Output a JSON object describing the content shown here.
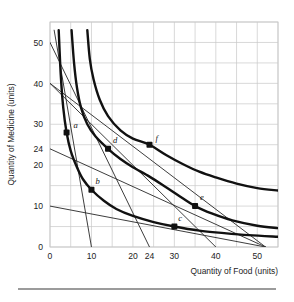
{
  "figure": {
    "name": "indifference-curve-budget-line-graph",
    "background": "#ffffff",
    "grid_color": "#c9c9c9",
    "curve_color": "#111111",
    "line_color": "#333333",
    "point_color": "#111111"
  },
  "axes": {
    "x_title": "Quantity of Food (units)",
    "y_title": "Quantity of Medicine (units)",
    "x_ticks": [
      "0",
      "10",
      "20",
      "24",
      "30",
      "40",
      "50"
    ],
    "y_ticks": [
      "0",
      "10",
      "20",
      "24",
      "30",
      "40",
      "50"
    ],
    "x_min": 0,
    "x_max": 55,
    "y_min": 0,
    "y_max": 55,
    "grid_step": 5
  },
  "chart_data": {
    "type": "line",
    "title": "",
    "xlabel": "Quantity of Food (units)",
    "ylabel": "Quantity of Medicine (units)",
    "xlim": [
      0,
      55
    ],
    "ylim": [
      0,
      55
    ],
    "grid": true,
    "legend": "none",
    "x_ticks": [
      0,
      10,
      20,
      24,
      30,
      40,
      50
    ],
    "y_ticks": [
      0,
      10,
      20,
      24,
      30,
      40,
      50
    ],
    "series": [
      {
        "name": "indifference-curve-1",
        "kind": "indifference-curve",
        "note": "lowest curve, passes through points b and c",
        "points": [
          [
            2.1,
            53
          ],
          [
            2.6,
            42
          ],
          [
            3.2,
            34
          ],
          [
            4.0,
            28
          ],
          [
            5.0,
            23.5
          ],
          [
            6.5,
            19.5
          ],
          [
            8.0,
            16.5
          ],
          [
            10.0,
            14.0
          ],
          [
            13.0,
            11.3
          ],
          [
            16.0,
            9.3
          ],
          [
            20.0,
            7.6
          ],
          [
            25.0,
            6.1
          ],
          [
            30.0,
            5.0
          ],
          [
            36.0,
            4.0
          ],
          [
            42.0,
            3.4
          ],
          [
            48.0,
            2.9
          ],
          [
            55.0,
            2.5
          ]
        ]
      },
      {
        "name": "indifference-curve-2",
        "kind": "indifference-curve",
        "note": "middle curve, passes through points a, d and e",
        "points": [
          [
            5.2,
            53
          ],
          [
            5.8,
            45
          ],
          [
            6.5,
            39
          ],
          [
            7.5,
            34
          ],
          [
            9.0,
            30
          ],
          [
            11.0,
            27
          ],
          [
            14.0,
            24.0
          ],
          [
            17.0,
            21.5
          ],
          [
            20.0,
            19.5
          ],
          [
            24.0,
            17.2
          ],
          [
            28.0,
            14.6
          ],
          [
            31.0,
            12.6
          ],
          [
            35.0,
            10.0
          ],
          [
            39.0,
            8.2
          ],
          [
            44.0,
            6.5
          ],
          [
            50.0,
            5.2
          ],
          [
            55.0,
            4.6
          ]
        ]
      },
      {
        "name": "indifference-curve-3",
        "kind": "indifference-curve",
        "note": "highest curve, passes through point f",
        "points": [
          [
            9.0,
            53
          ],
          [
            9.6,
            46
          ],
          [
            10.5,
            41
          ],
          [
            12.0,
            36
          ],
          [
            14.0,
            32
          ],
          [
            17.0,
            28.5
          ],
          [
            20.0,
            26.5
          ],
          [
            24.0,
            25.0
          ],
          [
            28.0,
            22.5
          ],
          [
            32.0,
            20.3
          ],
          [
            36.0,
            18.4
          ],
          [
            40.0,
            17.0
          ],
          [
            45.0,
            15.5
          ],
          [
            50.0,
            14.4
          ],
          [
            55.0,
            13.8
          ]
        ]
      },
      {
        "name": "budget-line-1",
        "kind": "budget-line",
        "note": "steepest budget line, from about (1,53) to (10,0)",
        "x_intercept": 10,
        "y_intercept": 53,
        "points": [
          [
            1.0,
            53.0
          ],
          [
            10.0,
            0.0
          ]
        ]
      },
      {
        "name": "budget-line-2",
        "kind": "budget-line",
        "note": "from (0,50) down to about (24,0)",
        "x_intercept": 24,
        "y_intercept": 50,
        "points": [
          [
            0.0,
            50.0
          ],
          [
            24.0,
            0.0
          ]
        ]
      },
      {
        "name": "budget-line-3",
        "kind": "budget-line",
        "note": "from (0,40) down to about (40,0), tangent near point e",
        "x_intercept": 40,
        "y_intercept": 40,
        "points": [
          [
            0.0,
            40.0
          ],
          [
            40.0,
            0.0
          ]
        ]
      },
      {
        "name": "budget-line-4",
        "kind": "budget-line",
        "note": "from (0,40) down to about (52,0)",
        "x_intercept": 52,
        "y_intercept": 40,
        "points": [
          [
            0.0,
            40.0
          ],
          [
            52.0,
            0.0
          ]
        ]
      },
      {
        "name": "budget-line-5",
        "kind": "budget-line",
        "note": "from (0,24) down to about (52,0)",
        "x_intercept": 52,
        "y_intercept": 24,
        "points": [
          [
            0.0,
            24.0
          ],
          [
            52.0,
            0.0
          ]
        ]
      },
      {
        "name": "budget-line-6",
        "kind": "budget-line",
        "note": "flattest budget line, from (0,10) to about (52,0)",
        "x_intercept": 52,
        "y_intercept": 10,
        "points": [
          [
            0.0,
            10.0
          ],
          [
            52.0,
            0.0
          ]
        ]
      }
    ],
    "annotated_points": [
      {
        "label": "a",
        "x": 4,
        "y": 28,
        "label_dx": 7,
        "label_dy": -4
      },
      {
        "label": "b",
        "x": 10,
        "y": 14,
        "label_dx": 4,
        "label_dy": -6
      },
      {
        "label": "c",
        "x": 30,
        "y": 5,
        "label_dx": 4,
        "label_dy": -6
      },
      {
        "label": "d",
        "x": 14,
        "y": 24,
        "label_dx": 5,
        "label_dy": -6
      },
      {
        "label": "e",
        "x": 35,
        "y": 10,
        "label_dx": 5,
        "label_dy": -6
      },
      {
        "label": "f",
        "x": 24,
        "y": 25,
        "label_dx": 6,
        "label_dy": -4
      }
    ]
  }
}
